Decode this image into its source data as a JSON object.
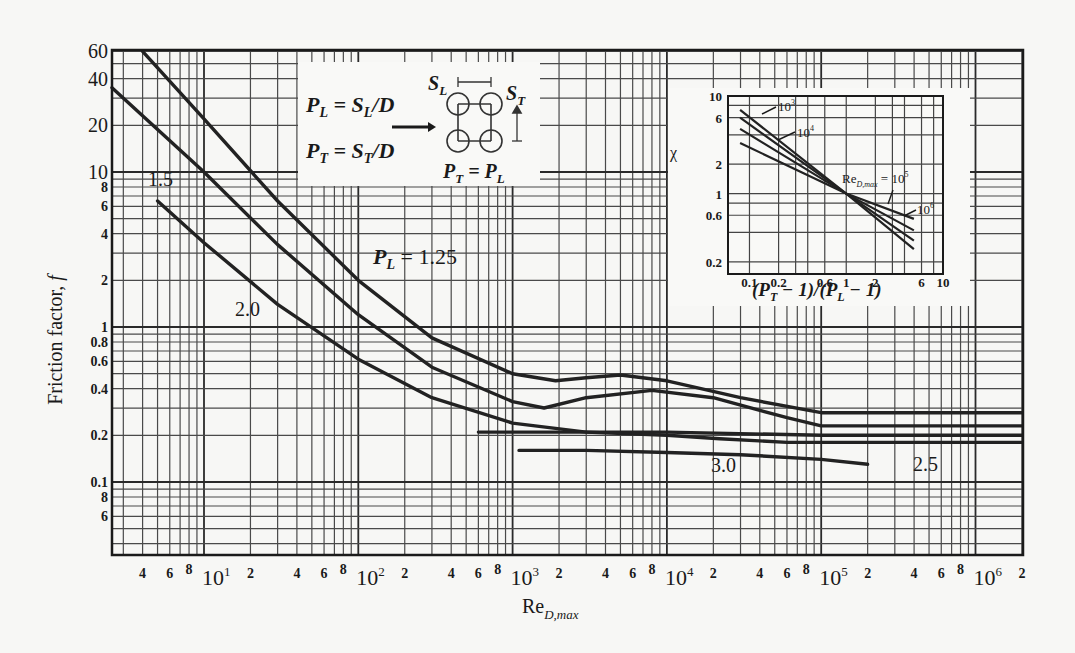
{
  "chart_data": {
    "type": "line",
    "title": "",
    "xlabel": "Re_D,max",
    "ylabel": "Friction factor, f",
    "xscale": "log",
    "yscale": "log",
    "xlim": [
      2.5,
      2000000
    ],
    "ylim": [
      0.05,
      60
    ],
    "grid": true,
    "x_ticks": [
      "4",
      "6",
      "8",
      "10^1",
      "2",
      "4",
      "6",
      "8",
      "10^2",
      "2",
      "4",
      "6",
      "8",
      "10^3",
      "2",
      "4",
      "6",
      "8",
      "10^4",
      "2",
      "4",
      "6",
      "8",
      "10^5",
      "2",
      "4",
      "6",
      "8",
      "10^6"
    ],
    "y_ticks": [
      "60",
      "40",
      "20",
      "10",
      "8",
      "6",
      "4",
      "2",
      "1",
      "0.8",
      "0.6",
      "0.4",
      "0.2",
      "0.1",
      "8",
      "6"
    ],
    "series": [
      {
        "name": "P_L = 1.25",
        "label": "P_L = 1.25",
        "x": [
          4,
          10,
          30,
          100,
          300,
          1000,
          1900,
          3000,
          5000,
          10000,
          30000,
          100000,
          300000,
          2000000
        ],
        "y": [
          60,
          22,
          6.5,
          2.0,
          0.85,
          0.5,
          0.45,
          0.47,
          0.49,
          0.45,
          0.35,
          0.28,
          0.28,
          0.28
        ]
      },
      {
        "name": "P_L = 1.5",
        "label": "1.5",
        "x": [
          2.5,
          10,
          30,
          100,
          300,
          1000,
          1600,
          3000,
          8000,
          20000,
          60000,
          100000,
          2000000
        ],
        "y": [
          35,
          10,
          3.4,
          1.2,
          0.55,
          0.33,
          0.3,
          0.35,
          0.39,
          0.35,
          0.26,
          0.23,
          0.23
        ]
      },
      {
        "name": "P_L = 2.0",
        "label": "2.0",
        "x": [
          5,
          10,
          30,
          100,
          300,
          1000,
          3000,
          10000,
          100000,
          2000000
        ],
        "y": [
          6.5,
          3.5,
          1.4,
          0.62,
          0.35,
          0.24,
          0.21,
          0.21,
          0.2,
          0.2
        ]
      },
      {
        "name": "P_L = 3.0",
        "label": "3.0",
        "x": [
          600,
          1000,
          3000,
          10000,
          22000,
          60000,
          100000,
          2000000
        ],
        "y": [
          0.21,
          0.21,
          0.21,
          0.2,
          0.19,
          0.18,
          0.18,
          0.18
        ]
      },
      {
        "name": "P_L = 2.5",
        "label": "2.5",
        "x": [
          1100,
          3000,
          10000,
          30000,
          100000,
          200000
        ],
        "y": [
          0.16,
          0.16,
          0.155,
          0.15,
          0.14,
          0.13
        ]
      }
    ],
    "annotations": [
      "P_L = S_L/D",
      "P_T = S_T/D",
      "P_T = P_L",
      "S_L",
      "S_T"
    ],
    "inset": {
      "type": "line",
      "xscale": "log",
      "yscale": "log",
      "xlabel": "(P_T − 1)/(P_L − 1)",
      "ylabel": "χ",
      "xlim": [
        0.06,
        10
      ],
      "ylim": [
        0.15,
        10
      ],
      "x_ticks": [
        "0.1",
        "0.2",
        "0.6",
        "1",
        "2",
        "6",
        "10"
      ],
      "y_ticks": [
        "10",
        "6",
        "2",
        "1",
        "0.6",
        "0.2"
      ],
      "series": [
        {
          "name": "Re_D,max = 10^3",
          "x": [
            0.08,
            1,
            5
          ],
          "y": [
            7.2,
            1.0,
            0.27
          ]
        },
        {
          "name": "Re_D,max = 10^4",
          "x": [
            0.08,
            1,
            5
          ],
          "y": [
            6.0,
            1.0,
            0.33
          ]
        },
        {
          "name": "Re_D,max = 10^5",
          "x": [
            0.08,
            1,
            5
          ],
          "y": [
            4.6,
            1.0,
            0.42
          ]
        },
        {
          "name": "Re_D,max = 10^6",
          "x": [
            0.08,
            1,
            5
          ],
          "y": [
            3.3,
            1.0,
            0.55
          ]
        }
      ],
      "labels": [
        "10^3",
        "10^4",
        "Re_D,max = 10^5",
        "10^6"
      ]
    }
  },
  "text": {
    "ylabel": "Friction factor, ",
    "ylabel_sym": "f",
    "xlabel_main": "Re",
    "xlabel_sub": "D,max",
    "curve_125": "P",
    "curve_125_sub": "L",
    "curve_125_val": " = 1.25",
    "curve_15": "1.5",
    "curve_20": "2.0",
    "curve_30": "3.0",
    "curve_25": "2.5",
    "pl_def": "= S",
    "pt_def": "= S",
    "inset_ylabel": "χ",
    "inset_xlabel": "(P",
    "inset_10_3": "10",
    "inset_10_4": "10",
    "inset_re": "Re",
    "inset_10_5": "= 10",
    "inset_10_6": "10"
  }
}
